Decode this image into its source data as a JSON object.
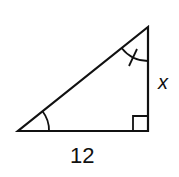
{
  "diagram": {
    "type": "right-triangle",
    "labels": {
      "base": "12",
      "vertical_side": "x"
    },
    "marks": {
      "right_angle": "bottom-right",
      "angle_single_arc": "bottom-left",
      "angle_arc_with_tick": "top"
    },
    "stroke_color": "#111111",
    "background": "#ffffff"
  }
}
